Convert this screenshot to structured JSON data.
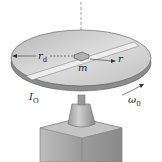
{
  "figure": {
    "labels": {
      "disk_radius": "r",
      "disk_radius_sub": "d",
      "mass": "m",
      "position": "r",
      "inertia": "I",
      "inertia_sub": "O",
      "angular_velocity": "ω",
      "angular_velocity_sub": "0"
    }
  },
  "colors": {
    "disk_top": "#c8c8c8",
    "disk_edge": "#9a9a9a",
    "slot": "#e8e8e8",
    "base": "#a8a8a8",
    "line": "#333333"
  }
}
